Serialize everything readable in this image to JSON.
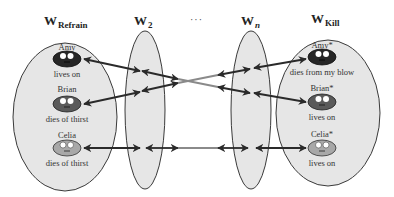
{
  "headings": {
    "refrain": {
      "base": "W",
      "sub": "Refrain"
    },
    "w2": {
      "base": "W",
      "sub": "2"
    },
    "ellipsis": "···",
    "wn": {
      "base": "W",
      "sub": "n"
    },
    "kill": {
      "base": "W",
      "sub": "Kill"
    }
  },
  "worlds": {
    "refrain": {
      "people": [
        {
          "name": "Amy",
          "fate": "lives on",
          "shade": "dark"
        },
        {
          "name": "Brian",
          "fate": "dies of  thirst",
          "shade": "medium"
        },
        {
          "name": "Celia",
          "fate": "dies of  thirst",
          "shade": "light"
        }
      ]
    },
    "kill": {
      "people": [
        {
          "name": "Amy*",
          "fate": "dies from my blow",
          "shade": "dark"
        },
        {
          "name": "Brian*",
          "fate": "lives on",
          "shade": "medium"
        },
        {
          "name": "Celia*",
          "fate": "lives on",
          "shade": "light"
        }
      ]
    }
  },
  "colors": {
    "ellipse_fill": "#e6e6e6",
    "ellipse_stroke": "#3a3a3a",
    "face_dark": "#262626",
    "face_medium": "#5a5a5a",
    "face_light": "#a8a8a8",
    "arrow": "#2a2a2a",
    "arrow_fade": "#8a8a8a"
  },
  "connections": [
    {
      "from": "Amy",
      "to": "Brian*"
    },
    {
      "from": "Brian",
      "to": "Amy*"
    },
    {
      "from": "Celia",
      "to": "Celia*"
    }
  ]
}
